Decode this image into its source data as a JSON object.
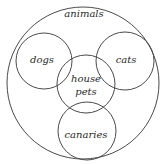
{
  "diagram": {
    "type": "venn",
    "stroke_color": "#4a4a4a",
    "text_color": "#2a2a2a",
    "sets": [
      {
        "id": "animals",
        "label": "animals",
        "cx": 83,
        "cy": 83,
        "r": 76,
        "label_x": 84,
        "label_y": 17
      },
      {
        "id": "dogs",
        "label": "dogs",
        "cx": 44,
        "cy": 61,
        "r": 28,
        "label_x": 42,
        "label_y": 63
      },
      {
        "id": "cats",
        "label": "cats",
        "cx": 125,
        "cy": 61,
        "r": 29,
        "label_x": 126,
        "label_y": 63
      },
      {
        "id": "house-pets",
        "label_line1": "house",
        "label_line2": "pets",
        "cx": 86,
        "cy": 84,
        "r": 29,
        "label_x": 86,
        "label_y1": 82,
        "label_y2": 95
      },
      {
        "id": "canaries",
        "label": "canaries",
        "cx": 87,
        "cy": 131,
        "r": 29,
        "label_x": 86,
        "label_y": 138
      }
    ]
  }
}
